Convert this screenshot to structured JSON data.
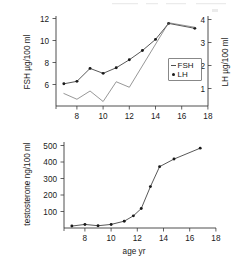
{
  "figure": {
    "name": "hormone-levels-by-age-figure",
    "panels": [
      "gonadotropins",
      "testosterone"
    ]
  },
  "chart_data": [
    {
      "id": "top",
      "type": "line",
      "title": "",
      "subtitle": "",
      "xlabel": "",
      "ylabel": "FSH   µg/100 ml",
      "ylabel_right": "LH   µg/100 ml",
      "xlim": [
        6.4,
        18
      ],
      "ylim": [
        5.1,
        12.4
      ],
      "ylim_right": [
        0.45,
        4.05
      ],
      "grid": false,
      "legend_position": "center-right",
      "xticks": [
        8,
        10,
        12,
        14,
        16,
        18
      ],
      "xticklabels": [
        "8",
        "10",
        "12",
        "14",
        "16",
        "18"
      ],
      "yticks": [
        6,
        8,
        10,
        12
      ],
      "yticklabels": [
        "6",
        "8",
        "10",
        "12"
      ],
      "yticks_right": [
        1,
        2,
        3,
        4
      ],
      "yticklabels_right": [
        "1",
        "2",
        "3",
        "4"
      ],
      "series": [
        {
          "name": "FSH",
          "axis": "left",
          "marker": "dot",
          "x": [
            7.0,
            8.0,
            9.0,
            10.0,
            11.0,
            12.0,
            13.0,
            14.0,
            15.0,
            17.0
          ],
          "values": [
            6.9,
            7.1,
            8.15,
            7.75,
            8.2,
            8.85,
            9.6,
            10.5,
            11.8,
            11.4
          ]
        },
        {
          "name": "LH",
          "axis": "right",
          "marker": "none",
          "x": [
            7.0,
            8.0,
            9.0,
            10.0,
            11.0,
            12.0,
            15.0,
            17.0
          ],
          "values": [
            0.95,
            0.72,
            1.05,
            0.63,
            1.42,
            1.2,
            3.78,
            3.6
          ]
        }
      ],
      "legend": [
        {
          "label": "FSH",
          "marker": "line"
        },
        {
          "label": "LH",
          "marker": "dot"
        }
      ]
    },
    {
      "id": "bottom",
      "type": "line",
      "title": "",
      "xlabel": "age   yr",
      "ylabel": "testosterone   ng/100 ml",
      "xlim": [
        6.4,
        18
      ],
      "ylim": [
        0,
        530
      ],
      "grid": false,
      "legend_position": "none",
      "xticks": [
        8,
        10,
        12,
        14,
        16,
        18
      ],
      "xticklabels": [
        "8",
        "10",
        "12",
        "14",
        "16",
        "18"
      ],
      "yticks": [
        100,
        200,
        300,
        400,
        500
      ],
      "yticklabels": [
        "100",
        "200",
        "300",
        "400",
        "500"
      ],
      "series": [
        {
          "name": "testosterone",
          "axis": "left",
          "marker": "dot",
          "x": [
            7.0,
            8.0,
            9.0,
            10.0,
            11.0,
            11.7,
            12.3,
            13.0,
            13.7,
            14.8,
            16.8
          ],
          "values": [
            12,
            22,
            14,
            22,
            42,
            75,
            120,
            255,
            378,
            425,
            492
          ]
        }
      ]
    }
  ],
  "labels": {
    "top_left_axis_title": "FSH   µg/100 ml",
    "top_right_axis_title": "LH   µg/100 ml",
    "bottom_left_axis_title": "testosterone   ng/100 ml",
    "bottom_x_axis_title": "age   yr",
    "legend_fsh": "FSH",
    "legend_lh": "LH"
  },
  "colors": {
    "ink": "#1a1a1a",
    "axis": "#3a3a3a",
    "secondary_line": "#6a6a6a",
    "background": "#ffffff"
  }
}
